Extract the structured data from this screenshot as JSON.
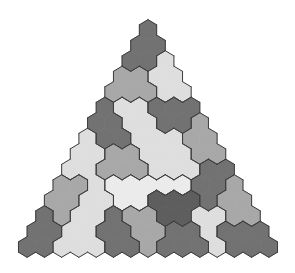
{
  "puzzle": {
    "title": "",
    "shape": "triangle",
    "rows": 15,
    "palette": {
      "D": "#727272",
      "V": "#5e5e5e",
      "M": "#a8a8a8",
      "L": "#dedede",
      "W": "#ebebeb"
    },
    "outline_color": "#3e3e3e",
    "grid": [
      "D",
      "DD",
      "DDL",
      "MMLL",
      "MMMLL",
      "DLLDDD",
      "DDLLDDM",
      "LDDLLLMM",
      "LLMMLLLMM",
      "LLMMMLLLDD",
      "MMLWWWWWDDM",
      "MMLLWWVVVDMM",
      "DMLLDMMVVLLMM",
      "DDLLDDMMDDLDDD",
      "DDLLLDDMDDDLDDD"
    ]
  }
}
